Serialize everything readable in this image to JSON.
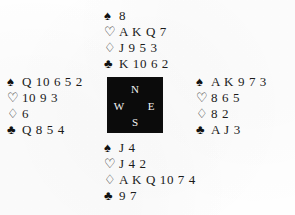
{
  "diagram": {
    "type": "bridge-deal-diagram",
    "background_color": "#fefefe",
    "text_color": "#1b1b1b"
  },
  "compass": {
    "box_color": "#0b0b0b",
    "label_color": "#f4f4f4",
    "north": "N",
    "west": "W",
    "east": "E",
    "south": "S"
  },
  "suits": {
    "spade": {
      "symbol": "♠",
      "name": "spade-symbol",
      "filled": true
    },
    "heart": {
      "symbol": "♡",
      "name": "heart-symbol",
      "filled": false
    },
    "diamond": {
      "symbol": "♢",
      "name": "diamond-symbol",
      "filled": false
    },
    "club": {
      "symbol": "♣",
      "name": "club-symbol",
      "filled": true
    }
  },
  "hands": {
    "north": {
      "position_label": "North",
      "spades": "8",
      "hearts": "A K Q 7",
      "diamonds": "J 9 5 3",
      "clubs": "K 10 6 2"
    },
    "west": {
      "position_label": "West",
      "spades": "Q 10 6 5 2",
      "hearts": "10 9 3",
      "diamonds": "6",
      "clubs": "Q 8 5 4"
    },
    "east": {
      "position_label": "East",
      "spades": "A K 9 7 3",
      "hearts": "8 6 5",
      "diamonds": "8 2",
      "clubs": "A J 3"
    },
    "south": {
      "position_label": "South",
      "spades": "J 4",
      "hearts": "J 4 2",
      "diamonds": "A K Q 10 7 4",
      "clubs": "9 7"
    }
  }
}
